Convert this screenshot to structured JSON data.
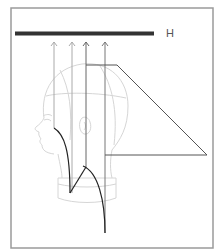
{
  "diagram": {
    "frame": {
      "x": 11,
      "y": 8,
      "width": 202,
      "height": 240,
      "stroke": "#999999"
    },
    "bar": {
      "x1": 15,
      "x2": 154,
      "y": 33.5,
      "thickness": 4,
      "color": "#333333"
    },
    "bar_label": "H",
    "arrows": [
      {
        "x": 54,
        "y_top": 42,
        "y_bottom": 128,
        "color": "#aaaaaa"
      },
      {
        "x": 72,
        "y_top": 42,
        "y_bottom": 193,
        "color": "#aaaaaa"
      },
      {
        "x": 86,
        "y_top": 42,
        "y_bottom": 167,
        "color": "#666666"
      },
      {
        "x": 105,
        "y_top": 42,
        "y_bottom": 233,
        "color": "#777777"
      }
    ],
    "guide_shape": {
      "points": [
        [
          86,
          65
        ],
        [
          117,
          65
        ],
        [
          207,
          155
        ],
        [
          105,
          155
        ]
      ],
      "color": "#555555"
    },
    "cut_lines": {
      "color": "#222222"
    },
    "head_outline_color": "#d8d8d8"
  }
}
